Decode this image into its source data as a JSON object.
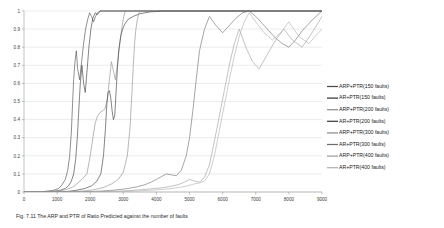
{
  "figure": {
    "caption_prefix": "Fig. 7.11",
    "caption_text": "Fig. 7.11   The ARP and PTR of Ratio Predicted against the number of faults"
  },
  "chart_data": {
    "type": "line",
    "title": "",
    "xlabel": "",
    "ylabel": "",
    "xlim": [
      0,
      9000
    ],
    "ylim": [
      0,
      1
    ],
    "grid": true,
    "legend_position": "right",
    "xticks": [
      0,
      1000,
      2000,
      3000,
      4000,
      5000,
      6000,
      7000,
      8000,
      9000
    ],
    "xtick_labels": [
      "0",
      "1000",
      "2000",
      "3000",
      "4000",
      "5000",
      "6000",
      "7000",
      "8000",
      "9000"
    ],
    "yticks": [
      0,
      0.1,
      0.2,
      0.3,
      0.4,
      0.5,
      0.6,
      0.7,
      0.8,
      0.9,
      1
    ],
    "ytick_labels": [
      "0",
      "0.1",
      "0.2",
      "0.3",
      "0.4",
      "0.5",
      "0.6",
      "0.7",
      "0.8",
      "0.9",
      "1"
    ],
    "series": [
      {
        "name": "ARP+PTR(150 faults)",
        "color": "#4a4a4a",
        "x": [
          0,
          500,
          700,
          900,
          1050,
          1150,
          1250,
          1320,
          1380,
          1430,
          1470,
          1500,
          1540,
          1580,
          1620,
          1680,
          1740,
          1800,
          1860,
          1920,
          1980,
          2040,
          2100,
          2160,
          2220,
          2300,
          9000
        ],
        "y": [
          0,
          0,
          0.005,
          0.01,
          0.02,
          0.04,
          0.07,
          0.12,
          0.2,
          0.33,
          0.5,
          0.62,
          0.72,
          0.78,
          0.68,
          0.62,
          0.72,
          0.82,
          0.9,
          0.95,
          0.99,
          0.97,
          0.94,
          0.97,
          0.99,
          1,
          1
        ]
      },
      {
        "name": "AR+PTR(150 faults)",
        "color": "#3a3a3a",
        "x": [
          0,
          600,
          900,
          1100,
          1250,
          1350,
          1430,
          1500,
          1560,
          1610,
          1660,
          1700,
          1750,
          1800,
          1850,
          1900,
          1960,
          2020,
          2080,
          2150,
          2220,
          2300,
          9000
        ],
        "y": [
          0,
          0,
          0.004,
          0.01,
          0.02,
          0.035,
          0.06,
          0.1,
          0.18,
          0.3,
          0.47,
          0.6,
          0.7,
          0.6,
          0.55,
          0.66,
          0.8,
          0.9,
          0.96,
          0.99,
          0.98,
          1,
          1
        ]
      },
      {
        "name": "ARP+PTR(200 faults)",
        "color": "#8c8c8c",
        "x": [
          0,
          700,
          1000,
          1250,
          1450,
          1600,
          1750,
          1900,
          2000,
          2080,
          2150,
          2220,
          2300,
          2380,
          2450,
          2520,
          2580,
          2640,
          2700,
          2760,
          2820,
          2880,
          2950,
          3010,
          3060,
          3100,
          9000
        ],
        "y": [
          0,
          0,
          0.004,
          0.012,
          0.025,
          0.045,
          0.07,
          0.1,
          0.2,
          0.3,
          0.38,
          0.42,
          0.44,
          0.45,
          0.46,
          0.52,
          0.62,
          0.72,
          0.67,
          0.62,
          0.7,
          0.8,
          0.9,
          0.97,
          1,
          1,
          1
        ]
      },
      {
        "name": "AR+PTR(200 faults)",
        "color": "#3a3a3a",
        "x": [
          0,
          900,
          1300,
          1600,
          1850,
          2050,
          2200,
          2320,
          2400,
          2460,
          2500,
          2540,
          2580,
          2620,
          2660,
          2700,
          2740,
          2780,
          2820,
          2860,
          2920,
          2980,
          3050,
          3150,
          3300,
          3500,
          3800,
          4200,
          4600,
          9000
        ],
        "y": [
          0,
          0,
          0.003,
          0.01,
          0.02,
          0.035,
          0.06,
          0.1,
          0.2,
          0.35,
          0.48,
          0.55,
          0.56,
          0.52,
          0.45,
          0.4,
          0.42,
          0.55,
          0.68,
          0.78,
          0.86,
          0.9,
          0.93,
          0.955,
          0.97,
          0.985,
          0.995,
          1,
          1,
          1
        ]
      },
      {
        "name": "ARP+PTR(300 faults)",
        "color": "#8c8c8c",
        "x": [
          0,
          1200,
          1700,
          2100,
          2400,
          2650,
          2850,
          3000,
          3120,
          3200,
          3260,
          3300,
          3340,
          3380,
          3420,
          3460,
          3500,
          3560,
          3620,
          3700,
          9000
        ],
        "y": [
          0,
          0,
          0.004,
          0.012,
          0.025,
          0.045,
          0.07,
          0.11,
          0.2,
          0.35,
          0.55,
          0.7,
          0.82,
          0.9,
          0.95,
          0.98,
          1,
          1,
          1,
          1,
          1
        ]
      },
      {
        "name": "AR+PTR(300 faults)",
        "color": "#6e6e6e",
        "x": [
          0,
          1500,
          2200,
          2700,
          3100,
          3400,
          3650,
          3850,
          4000,
          4150,
          4300,
          4450,
          4600,
          4750,
          4900,
          5000,
          5100,
          5200,
          5300,
          5450,
          5600,
          5800,
          6000,
          6200,
          6400,
          6600,
          6800,
          7000,
          7200,
          7400,
          7600,
          7800,
          8000,
          8200,
          8400,
          8700,
          9000
        ],
        "y": [
          0,
          0,
          0.004,
          0.01,
          0.018,
          0.028,
          0.04,
          0.055,
          0.07,
          0.085,
          0.1,
          0.095,
          0.09,
          0.12,
          0.2,
          0.3,
          0.45,
          0.62,
          0.78,
          0.9,
          0.97,
          0.92,
          0.88,
          0.92,
          0.96,
          0.99,
          1,
          0.97,
          0.93,
          0.89,
          0.85,
          0.82,
          0.8,
          0.84,
          0.89,
          0.95,
          1
        ]
      },
      {
        "name": "ARP+PTR(400 faults)",
        "color": "#9e9e9e",
        "x": [
          0,
          1800,
          2600,
          3200,
          3700,
          4100,
          4400,
          4650,
          4850,
          5000,
          5150,
          5300,
          5450,
          5600,
          5750,
          5900,
          6050,
          6200,
          6350,
          6500,
          6700,
          6900,
          7100,
          7350,
          7600,
          7850,
          8100,
          8400,
          8700,
          9000
        ],
        "y": [
          0,
          0,
          0.003,
          0.008,
          0.015,
          0.022,
          0.03,
          0.04,
          0.055,
          0.07,
          0.06,
          0.055,
          0.08,
          0.15,
          0.28,
          0.42,
          0.56,
          0.7,
          0.82,
          0.9,
          0.8,
          0.72,
          0.68,
          0.76,
          0.84,
          0.9,
          0.84,
          0.8,
          0.88,
          0.97
        ]
      },
      {
        "name": "AR+PTR(400 faults)",
        "color": "#b0b0b0",
        "x": [
          0,
          2000,
          2900,
          3500,
          4000,
          4400,
          4700,
          4950,
          5150,
          5300,
          5450,
          5600,
          5750,
          5900,
          6050,
          6200,
          6350,
          6500,
          6650,
          6800,
          7000,
          7250,
          7500,
          7750,
          8000,
          8300,
          8600,
          9000
        ],
        "y": [
          0,
          0,
          0.002,
          0.006,
          0.012,
          0.018,
          0.025,
          0.035,
          0.045,
          0.05,
          0.06,
          0.1,
          0.2,
          0.34,
          0.48,
          0.62,
          0.75,
          0.86,
          0.94,
          0.99,
          0.94,
          0.88,
          0.84,
          0.88,
          0.94,
          0.86,
          0.82,
          0.9
        ]
      }
    ]
  },
  "legend": {
    "items": [
      {
        "label": "ARP+PTR(150 faults)",
        "color": "#4a4a4a"
      },
      {
        "label": "AR+PTR(150 faults)",
        "color": "#3a3a3a"
      },
      {
        "label": "ARP+PTR(200 faults)",
        "color": "#8c8c8c"
      },
      {
        "label": "AR+PTR(200 faults)",
        "color": "#3a3a3a"
      },
      {
        "label": "ARP+PTR(300 faults)",
        "color": "#8c8c8c"
      },
      {
        "label": "AR+PTR(300 faults)",
        "color": "#6e6e6e"
      },
      {
        "label": "ARP+PTR(400 faults)",
        "color": "#9e9e9e"
      },
      {
        "label": "AR+PTR(400 faults)",
        "color": "#b0b0b0"
      }
    ]
  }
}
